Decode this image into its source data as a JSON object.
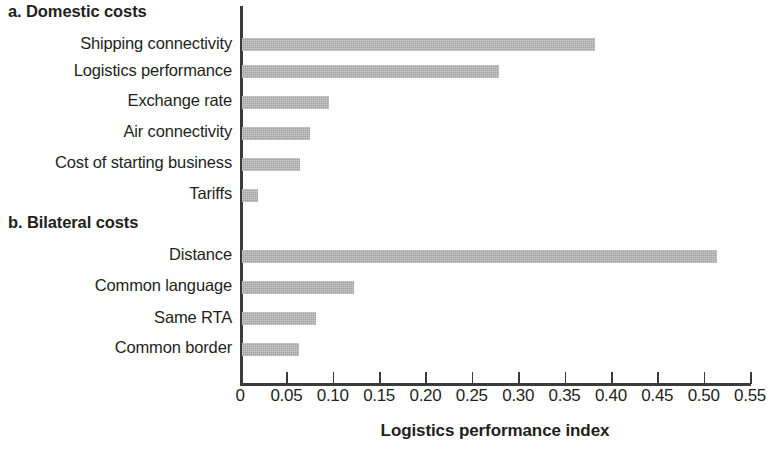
{
  "figure": {
    "axis_title": "Logistics performance index"
  },
  "panels": [
    {
      "id": "a",
      "heading": "a. Domestic costs"
    },
    {
      "id": "b",
      "heading": "b. Bilateral costs"
    }
  ],
  "axis": {
    "tick_labels": [
      "0",
      "0.05",
      "0.10",
      "0.15",
      "0.20",
      "0.25",
      "0.30",
      "0.35",
      "0.40",
      "0.45",
      "0.50",
      "0.55"
    ]
  },
  "labels": {
    "shipping_connectivity": "Shipping connectivity",
    "logistics_performance": "Logistics performance",
    "exchange_rate": "Exchange rate",
    "air_connectivity": "Air connectivity",
    "cost_of_starting_business": "Cost of starting business",
    "tariffs": "Tariffs",
    "distance": "Distance",
    "common_language": "Common language",
    "same_rta": "Same RTA",
    "common_border": "Common border"
  },
  "chart_data": {
    "type": "bar",
    "orientation": "horizontal",
    "title": "",
    "xlabel": "Logistics performance index",
    "ylabel": "",
    "xlim": [
      0,
      0.55
    ],
    "xticks": [
      0,
      0.05,
      0.1,
      0.15,
      0.2,
      0.25,
      0.3,
      0.35,
      0.4,
      0.45,
      0.5,
      0.55
    ],
    "grid": false,
    "legend": null,
    "bar_color": "#b6b6b6",
    "panels": [
      {
        "id": "a",
        "title": "a. Domestic costs",
        "categories": [
          "Shipping connectivity",
          "Logistics performance",
          "Exchange rate",
          "Air connectivity",
          "Cost of starting business",
          "Tariffs"
        ],
        "values": [
          0.381,
          0.277,
          0.094,
          0.073,
          0.063,
          0.017
        ]
      },
      {
        "id": "b",
        "title": "b. Bilateral costs",
        "categories": [
          "Distance",
          "Common language",
          "Same RTA",
          "Common border"
        ],
        "values": [
          0.512,
          0.121,
          0.08,
          0.062
        ]
      }
    ]
  }
}
